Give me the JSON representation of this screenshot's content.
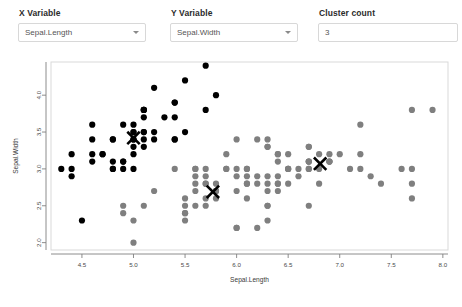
{
  "controls": {
    "x_variable": {
      "label": "X Variable",
      "value": "Sepal.Length",
      "icon": "chevron-down-icon"
    },
    "y_variable": {
      "label": "Y Variable",
      "value": "Sepal.Width",
      "icon": "chevron-down-icon"
    },
    "cluster_count": {
      "label": "Cluster count",
      "value": "3",
      "placeholder": ""
    }
  },
  "colors": {
    "cluster_1": "#000000",
    "cluster_2": "#7f7f7f",
    "centroid": "#000000",
    "panel_border": "#d9d9d9",
    "axis": "#808080"
  },
  "chart_data": {
    "type": "scatter",
    "title": "",
    "xlabel": "Sepal.Length",
    "ylabel": "Sepal.Width",
    "xlim": [
      4.2,
      8.05
    ],
    "ylim": [
      1.9,
      4.45
    ],
    "xticks": [
      4.5,
      5.0,
      5.5,
      6.0,
      6.5,
      7.0,
      7.5,
      8.0
    ],
    "yticks": [
      2.0,
      2.5,
      3.0,
      3.5,
      4.0
    ],
    "grid": false,
    "legend": "none",
    "series": [
      {
        "name": "Cluster 1",
        "color": "#000000",
        "points": [
          [
            5.1,
            3.5
          ],
          [
            4.9,
            3.0
          ],
          [
            4.7,
            3.2
          ],
          [
            4.6,
            3.1
          ],
          [
            5.0,
            3.6
          ],
          [
            5.4,
            3.9
          ],
          [
            4.6,
            3.4
          ],
          [
            5.0,
            3.4
          ],
          [
            4.4,
            2.9
          ],
          [
            4.9,
            3.1
          ],
          [
            5.4,
            3.7
          ],
          [
            4.8,
            3.4
          ],
          [
            4.8,
            3.0
          ],
          [
            4.3,
            3.0
          ],
          [
            5.8,
            4.0
          ],
          [
            5.7,
            4.4
          ],
          [
            5.4,
            3.9
          ],
          [
            5.1,
            3.5
          ],
          [
            5.7,
            3.8
          ],
          [
            5.1,
            3.8
          ],
          [
            5.4,
            3.4
          ],
          [
            5.1,
            3.7
          ],
          [
            4.6,
            3.6
          ],
          [
            5.1,
            3.3
          ],
          [
            4.8,
            3.4
          ],
          [
            5.0,
            3.0
          ],
          [
            5.0,
            3.4
          ],
          [
            5.2,
            3.5
          ],
          [
            5.2,
            3.4
          ],
          [
            4.7,
            3.2
          ],
          [
            4.8,
            3.1
          ],
          [
            5.4,
            3.4
          ],
          [
            5.2,
            4.1
          ],
          [
            5.5,
            4.2
          ],
          [
            4.9,
            3.1
          ],
          [
            5.0,
            3.2
          ],
          [
            5.5,
            3.5
          ],
          [
            4.9,
            3.6
          ],
          [
            4.4,
            3.0
          ],
          [
            5.1,
            3.4
          ],
          [
            5.0,
            3.5
          ],
          [
            4.5,
            2.3
          ],
          [
            4.4,
            3.2
          ],
          [
            5.0,
            3.5
          ],
          [
            5.1,
            3.8
          ],
          [
            4.8,
            3.0
          ],
          [
            5.1,
            3.8
          ],
          [
            4.6,
            3.2
          ],
          [
            5.3,
            3.7
          ],
          [
            5.0,
            3.3
          ]
        ]
      },
      {
        "name": "Cluster 2",
        "color": "#7f7f7f",
        "points": [
          [
            7.0,
            3.2
          ],
          [
            6.4,
            3.2
          ],
          [
            6.9,
            3.1
          ],
          [
            5.5,
            2.3
          ],
          [
            6.5,
            2.8
          ],
          [
            5.7,
            2.8
          ],
          [
            6.3,
            3.3
          ],
          [
            4.9,
            2.4
          ],
          [
            6.6,
            2.9
          ],
          [
            5.2,
            2.7
          ],
          [
            5.0,
            2.0
          ],
          [
            5.9,
            3.0
          ],
          [
            6.0,
            2.2
          ],
          [
            6.1,
            2.9
          ],
          [
            5.6,
            2.9
          ],
          [
            6.7,
            3.1
          ],
          [
            5.6,
            3.0
          ],
          [
            5.8,
            2.7
          ],
          [
            6.2,
            2.2
          ],
          [
            5.6,
            2.5
          ],
          [
            5.9,
            3.2
          ],
          [
            6.1,
            2.8
          ],
          [
            6.3,
            2.5
          ],
          [
            6.1,
            2.8
          ],
          [
            6.4,
            2.9
          ],
          [
            6.6,
            3.0
          ],
          [
            6.8,
            2.8
          ],
          [
            6.7,
            3.0
          ],
          [
            6.0,
            2.9
          ],
          [
            5.7,
            2.6
          ],
          [
            5.5,
            2.4
          ],
          [
            5.5,
            2.4
          ],
          [
            5.8,
            2.7
          ],
          [
            6.0,
            2.7
          ],
          [
            5.4,
            3.0
          ],
          [
            6.0,
            3.4
          ],
          [
            6.7,
            3.1
          ],
          [
            6.3,
            2.3
          ],
          [
            5.6,
            3.0
          ],
          [
            5.5,
            2.5
          ],
          [
            5.5,
            2.6
          ],
          [
            6.1,
            3.0
          ],
          [
            5.8,
            2.6
          ],
          [
            5.0,
            2.3
          ],
          [
            5.6,
            2.7
          ],
          [
            5.7,
            3.0
          ],
          [
            5.7,
            2.9
          ],
          [
            6.2,
            2.9
          ],
          [
            5.1,
            2.5
          ],
          [
            5.7,
            2.8
          ],
          [
            6.3,
            3.3
          ],
          [
            5.8,
            2.7
          ],
          [
            7.1,
            3.0
          ],
          [
            6.3,
            2.9
          ],
          [
            6.5,
            3.0
          ],
          [
            7.6,
            3.0
          ],
          [
            4.9,
            2.5
          ],
          [
            7.3,
            2.9
          ],
          [
            6.7,
            2.5
          ],
          [
            7.2,
            3.6
          ],
          [
            6.5,
            3.2
          ],
          [
            6.4,
            2.7
          ],
          [
            6.8,
            3.0
          ],
          [
            5.7,
            2.5
          ],
          [
            5.8,
            2.8
          ],
          [
            6.4,
            3.2
          ],
          [
            6.5,
            3.0
          ],
          [
            7.7,
            3.8
          ],
          [
            7.7,
            2.6
          ],
          [
            6.0,
            2.2
          ],
          [
            6.9,
            3.2
          ],
          [
            5.6,
            2.8
          ],
          [
            7.7,
            2.8
          ],
          [
            6.3,
            2.7
          ],
          [
            6.7,
            3.3
          ],
          [
            7.2,
            3.2
          ],
          [
            6.2,
            2.8
          ],
          [
            6.1,
            3.0
          ],
          [
            6.4,
            2.8
          ],
          [
            7.2,
            3.0
          ],
          [
            7.4,
            2.8
          ],
          [
            7.9,
            3.8
          ],
          [
            6.4,
            2.8
          ],
          [
            6.3,
            2.8
          ],
          [
            6.1,
            2.6
          ],
          [
            7.7,
            3.0
          ],
          [
            6.3,
            3.4
          ],
          [
            6.4,
            3.1
          ],
          [
            6.0,
            3.0
          ],
          [
            6.9,
            3.1
          ],
          [
            6.7,
            3.1
          ],
          [
            6.9,
            3.1
          ],
          [
            5.8,
            2.7
          ],
          [
            6.8,
            3.2
          ],
          [
            6.7,
            3.3
          ],
          [
            6.7,
            3.0
          ],
          [
            6.3,
            2.5
          ],
          [
            6.5,
            3.0
          ],
          [
            6.2,
            3.4
          ],
          [
            5.9,
            3.0
          ]
        ]
      }
    ],
    "centroids": [
      {
        "name": "centroid-1",
        "x": 5.0,
        "y": 3.42
      },
      {
        "name": "centroid-2",
        "x": 5.77,
        "y": 2.69
      },
      {
        "name": "centroid-3",
        "x": 6.81,
        "y": 3.07
      }
    ]
  }
}
